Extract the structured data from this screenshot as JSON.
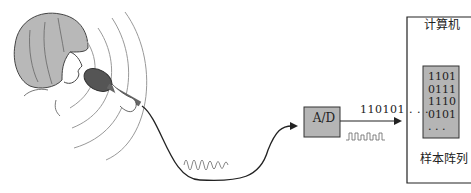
{
  "diagram": {
    "converter": {
      "label": "A/D"
    },
    "digital_output": {
      "label": "110101 . . ."
    },
    "computer": {
      "title": "计算机",
      "sample_array": {
        "rows": [
          "1101",
          "0111",
          "1110",
          "0101",
          ". . ."
        ],
        "caption": "样本阵列"
      }
    },
    "colors": {
      "hair": "#b8b8b8",
      "microphone": "#555555",
      "box_fill": "#b5b5b5",
      "line": "#222222",
      "wave": "#888888"
    }
  }
}
